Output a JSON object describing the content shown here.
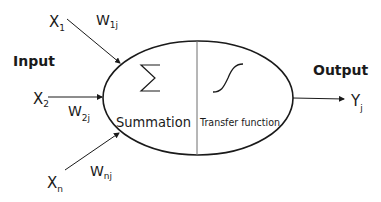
{
  "diagram": {
    "type": "artificial-neuron",
    "labels": {
      "input": "Input",
      "output": "Output",
      "summation": "Summation",
      "transfer": "Transfer function",
      "sigma": "∑"
    },
    "inputs": [
      {
        "x_main": "X",
        "x_sub": "1",
        "w_main": "W",
        "w_sub": "1j"
      },
      {
        "x_main": "X",
        "x_sub": "2",
        "w_main": "W",
        "w_sub": "2j"
      },
      {
        "x_main": "X",
        "x_sub": "n",
        "w_main": "W",
        "w_sub": "nj"
      }
    ],
    "output": {
      "main": "Y",
      "sub": "j"
    },
    "colors": {
      "stroke": "#1a1a1a",
      "divider": "#6e6e6e",
      "background": "#ffffff"
    }
  }
}
